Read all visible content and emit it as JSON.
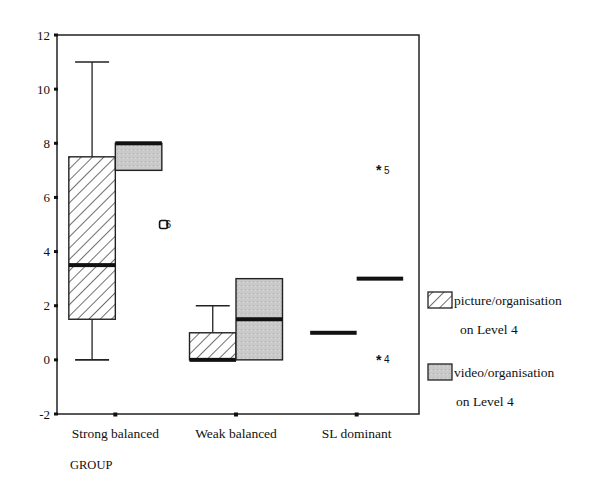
{
  "chart_data": {
    "type": "boxplot",
    "title": "",
    "xlabel": "GROUP",
    "ylabel": "",
    "ylim": [
      -2,
      12
    ],
    "yticks": [
      -2,
      0,
      2,
      4,
      6,
      8,
      10,
      12
    ],
    "grid": false,
    "legend_position": "right",
    "categories": [
      "Strong balanced",
      "Weak balanced",
      "SL dominant"
    ],
    "series": [
      {
        "name": "picture/organisation on Level 4",
        "legend_line1": "picture/organisation",
        "legend_line2": "on Level 4",
        "fill": "hatched",
        "boxes": [
          {
            "category": "Strong balanced",
            "whisker_low": 0,
            "q1": 1.5,
            "median": 3.5,
            "q3": 7.5,
            "whisker_high": 11,
            "outliers": [],
            "extremes": []
          },
          {
            "category": "Weak balanced",
            "whisker_low": 0,
            "q1": 0,
            "median": 0,
            "q3": 1,
            "whisker_high": 2,
            "outliers": [],
            "extremes": []
          },
          {
            "category": "SL dominant",
            "whisker_low": 1,
            "q1": 1,
            "median": 1,
            "q3": 1,
            "whisker_high": 1,
            "outliers": [],
            "extremes": []
          }
        ]
      },
      {
        "name": "video/organisation on Level 4",
        "legend_line1": "video/organisation",
        "legend_line2": "on Level 4",
        "fill": "#c8c8c8",
        "boxes": [
          {
            "category": "Strong balanced",
            "whisker_low": 7,
            "q1": 7,
            "median": 8,
            "q3": 8,
            "whisker_high": 8,
            "outliers": [
              {
                "value": 5,
                "label": "6"
              }
            ],
            "extremes": []
          },
          {
            "category": "Weak balanced",
            "whisker_low": 0,
            "q1": 0,
            "median": 1.5,
            "q3": 3,
            "whisker_high": 3,
            "outliers": [],
            "extremes": []
          },
          {
            "category": "SL dominant",
            "whisker_low": 3,
            "q1": 3,
            "median": 3,
            "q3": 3,
            "whisker_high": 3,
            "outliers": [],
            "extremes": [
              {
                "value": 7,
                "label": "5"
              },
              {
                "value": 0,
                "label": "4"
              }
            ]
          }
        ]
      }
    ]
  },
  "axis": {
    "x_title": "GROUP"
  }
}
